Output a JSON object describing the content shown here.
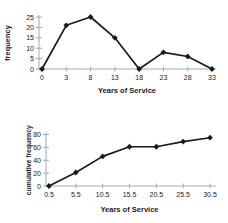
{
  "colors": {
    "series": "#1a1a1a",
    "marker": "#1a1a1a",
    "axis": "#a8a8a8",
    "text": "#1a1a1a",
    "background": "#ffffff"
  },
  "chart_data": [
    {
      "type": "line",
      "title": "",
      "xlabel": "Years of Service",
      "ylabel": "frequency",
      "categories": [
        "0",
        "3",
        "8",
        "13",
        "18",
        "23",
        "28",
        "33"
      ],
      "values": [
        0,
        21,
        25,
        15,
        0,
        8,
        6,
        0
      ],
      "yticks": [
        0,
        5,
        10,
        15,
        20,
        25
      ],
      "ylim": [
        0,
        25
      ],
      "grid": false,
      "legend": "none",
      "marker": "diamond"
    },
    {
      "type": "line",
      "title": "",
      "xlabel": "Years of Service",
      "ylabel": "cumulative frequency",
      "categories": [
        "0.5",
        "5.5",
        "10.5",
        "15.5",
        "20.5",
        "25.5",
        "30.5"
      ],
      "values": [
        0,
        21,
        46,
        61,
        61,
        69,
        75
      ],
      "yticks": [
        0,
        20,
        40,
        60,
        80
      ],
      "ylim": [
        0,
        80
      ],
      "grid": false,
      "legend": "none",
      "marker": "diamond"
    }
  ]
}
